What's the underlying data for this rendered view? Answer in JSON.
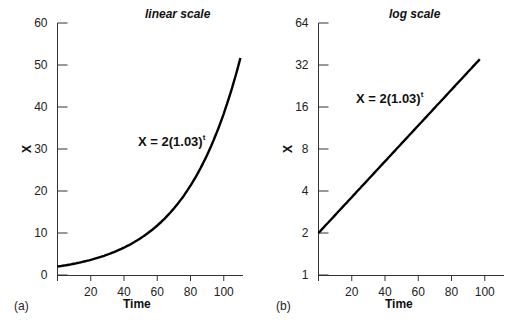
{
  "chart_data": [
    {
      "type": "line",
      "panel_label": "(a)",
      "title": "linear scale",
      "xlabel": "Time",
      "ylabel": "X",
      "equation": "X = 2(1.03)",
      "equation_exponent": "t",
      "xticks": [
        20,
        40,
        60,
        80,
        100
      ],
      "yticks": [
        0,
        10,
        20,
        30,
        40,
        50,
        60
      ],
      "xlim": [
        0,
        110
      ],
      "ylim": [
        0,
        60
      ],
      "yscale": "linear",
      "grid": false,
      "series": [
        {
          "name": "X = 2(1.03)^t",
          "x": [
            0,
            10,
            20,
            30,
            40,
            50,
            60,
            70,
            80,
            90,
            100,
            110
          ],
          "values": [
            2,
            2.69,
            3.61,
            4.85,
            6.52,
            8.77,
            11.78,
            15.84,
            21.28,
            28.6,
            38.44,
            51.66
          ]
        }
      ]
    },
    {
      "type": "line",
      "panel_label": "(b)",
      "title": "log scale",
      "xlabel": "Time",
      "ylabel": "X",
      "equation": "X = 2(1.03)",
      "equation_exponent": "t",
      "xticks": [
        20,
        40,
        60,
        80,
        100
      ],
      "yticks": [
        1,
        2,
        4,
        8,
        16,
        32,
        64
      ],
      "xlim": [
        0,
        110
      ],
      "ylim": [
        1,
        64
      ],
      "yscale": "log2",
      "grid": false,
      "series": [
        {
          "name": "X = 2(1.03)^t",
          "x": [
            0,
            20,
            40,
            60,
            80,
            97
          ],
          "values": [
            2,
            3.61,
            6.52,
            11.78,
            21.28,
            35.4
          ]
        }
      ]
    }
  ],
  "labels": {
    "a": {
      "title": "linear scale",
      "xlabel": "Time",
      "ylabel": "X",
      "panel": "(a)",
      "eq": "X = 2(1.03)",
      "eq_sup": "t",
      "yt": [
        "0",
        "10",
        "20",
        "30",
        "40",
        "50",
        "60"
      ],
      "xt": [
        "20",
        "40",
        "60",
        "80",
        "100"
      ]
    },
    "b": {
      "title": "log scale",
      "xlabel": "Time",
      "ylabel": "X",
      "panel": "(b)",
      "eq": "X = 2(1.03)",
      "eq_sup": "t",
      "yt": [
        "1",
        "2",
        "4",
        "8",
        "16",
        "32",
        "64"
      ],
      "xt": [
        "20",
        "40",
        "60",
        "80",
        "100"
      ]
    }
  },
  "colors": {
    "line": "#000000",
    "axis": "#333333",
    "text": "#222222"
  }
}
